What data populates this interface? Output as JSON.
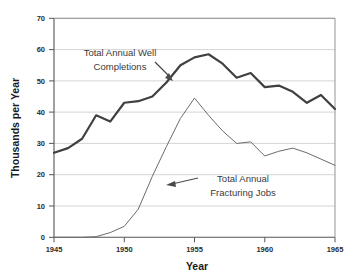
{
  "chart_data": {
    "type": "line",
    "title": "",
    "xlabel": "Year",
    "ylabel": "Thousands per Year",
    "xlim": [
      1945,
      1965
    ],
    "ylim": [
      0,
      70
    ],
    "grid": true,
    "legend_position": "none",
    "xticks": [
      "1945",
      "1950",
      "1955",
      "1960",
      "1965"
    ],
    "yticks": [
      "0",
      "10",
      "20",
      "30",
      "40",
      "50",
      "60",
      "70"
    ],
    "x": [
      1945,
      1946,
      1947,
      1948,
      1949,
      1950,
      1951,
      1952,
      1953,
      1954,
      1955,
      1956,
      1957,
      1958,
      1959,
      1960,
      1961,
      1962,
      1963,
      1964,
      1965
    ],
    "series": [
      {
        "name": "Total Annual Well Completions",
        "color": "#404040",
        "width": 2.2,
        "values": [
          27.0,
          28.5,
          31.5,
          39.0,
          37.0,
          43.0,
          43.5,
          45.0,
          49.5,
          55.0,
          57.5,
          58.5,
          55.5,
          51.0,
          52.5,
          48.0,
          48.5,
          46.5,
          43.0,
          45.5,
          41.0
        ]
      },
      {
        "name": "Total Annual Fracturing Jobs",
        "color": "#6b6b6b",
        "width": 1.0,
        "values": [
          0.0,
          0.0,
          0.0,
          0.2,
          1.5,
          3.5,
          9.0,
          19.5,
          29.0,
          38.0,
          44.5,
          39.0,
          34.0,
          30.0,
          30.5,
          26.0,
          27.5,
          28.5,
          27.0,
          25.0,
          23.0
        ]
      }
    ],
    "annotations": [
      {
        "id": "well-completions-annotation",
        "line1": "Total Annual Well",
        "line2": "Completions",
        "arrow_from": [
          155,
          62
        ],
        "arrow_to": [
          172,
          79
        ]
      },
      {
        "id": "fracturing-jobs-annotation",
        "line1": "Total Annual",
        "line2": "Fracturing Jobs",
        "arrow_from": [
          196,
          178
        ],
        "arrow_to": [
          164,
          184
        ]
      }
    ]
  }
}
